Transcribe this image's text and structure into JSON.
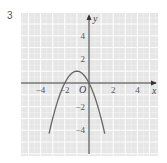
{
  "question_number": "3",
  "chart_data": {
    "type": "line",
    "title": "",
    "xlabel": "x",
    "ylabel": "y",
    "origin_label": "O",
    "xlim": [
      -5.5,
      5.8
    ],
    "ylim": [
      -6,
      6
    ],
    "grid": true,
    "x_ticks": [
      {
        "value": -4,
        "label": "−4"
      },
      {
        "value": -2,
        "label": "−2"
      },
      {
        "value": 2,
        "label": "2"
      },
      {
        "value": 4,
        "label": "4"
      }
    ],
    "y_ticks": [
      {
        "value": 4,
        "label": "4"
      },
      {
        "value": 2,
        "label": "2"
      },
      {
        "value": -2,
        "label": "−2"
      },
      {
        "value": -4,
        "label": "−4"
      }
    ],
    "series": [
      {
        "name": "y = -(x+1)^2 + 1",
        "equation": "y = -x^2 - 2x",
        "vertex": [
          -1,
          1
        ],
        "x_intercepts": [
          -2,
          0
        ],
        "x": [
          -3.3,
          -3,
          -2.5,
          -2,
          -1.5,
          -1,
          -0.5,
          0,
          0.5,
          1,
          1.3
        ],
        "values": [
          -4.29,
          -3,
          -1.25,
          0,
          0.75,
          1,
          0.75,
          0,
          -1.25,
          -3,
          -4.29
        ]
      }
    ],
    "colors": {
      "panel_bg": "#e6e6e6",
      "grid_line": "#ffffff",
      "axis": "#333333",
      "curve": "#666666"
    }
  }
}
